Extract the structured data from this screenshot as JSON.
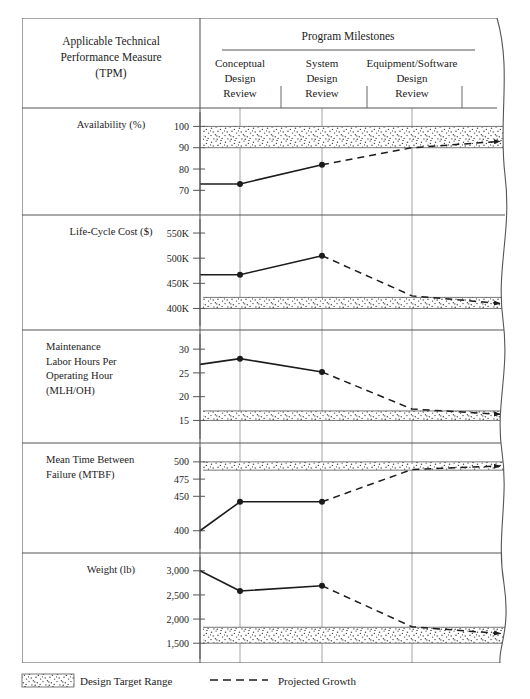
{
  "table": {
    "measure_header": [
      "Applicable Technical",
      "Performance Measure",
      "(TPM)"
    ],
    "milestones_header": "Program Milestones",
    "milestones": [
      {
        "name": "conceptual-design-review",
        "lines": [
          "Conceptual",
          "Design",
          "Review"
        ]
      },
      {
        "name": "system-design-review",
        "lines": [
          "System",
          "Design",
          "Review"
        ]
      },
      {
        "name": "equipment-software-design-review",
        "lines": [
          "Equipment/Software",
          "Design",
          "Review"
        ]
      }
    ]
  },
  "legend": {
    "design_target_range": "Design Target Range",
    "projected_growth": "Projected Growth"
  },
  "colors": {
    "ink": "#1c1c1c",
    "rule": "#555555",
    "grid": "#8a8a96",
    "band_fill": "#ffffff",
    "band_dot": "#2b2b2b",
    "paper": "#ffffff"
  },
  "chart_data": {
    "type": "line",
    "title": "Program Milestones",
    "xlabel": "",
    "grid": true,
    "legend_position": "bottom",
    "x_categories": [
      "Start",
      "Conceptual Design Review",
      "System Design Review",
      "Equipment/Software Design Review"
    ],
    "panels": [
      {
        "id": "availability",
        "label_lines": [
          "Availability (%)"
        ],
        "ylabel": "Availability (%)",
        "ylim": [
          65,
          103
        ],
        "ticks": [
          100,
          90,
          80,
          70
        ],
        "tick_labels": [
          "100",
          "90",
          "80",
          "70"
        ],
        "target_band": {
          "low": 90,
          "high": 100,
          "label": "Design Target Range"
        },
        "actual": {
          "name": "Actual",
          "x": [
            "Start",
            "Conceptual Design Review",
            "System Design Review"
          ],
          "values": [
            73,
            73,
            82
          ]
        },
        "projected": {
          "name": "Projected Growth",
          "x": [
            "System Design Review",
            "Equipment/Software Design Review",
            "End"
          ],
          "values": [
            82,
            90,
            93
          ]
        },
        "direction": "increasing"
      },
      {
        "id": "life-cycle-cost",
        "label_lines": [
          "Life-Cycle Cost ($)"
        ],
        "ylabel": "Life-Cycle Cost ($)",
        "ylim": [
          385,
          562
        ],
        "ticks": [
          550,
          500,
          450,
          400
        ],
        "tick_labels": [
          "550K",
          "500K",
          "450K",
          "400K"
        ],
        "target_band": {
          "low": 400,
          "high": 422,
          "label": "Design Target Range"
        },
        "actual": {
          "name": "Actual",
          "x": [
            "Start",
            "Conceptual Design Review",
            "System Design Review"
          ],
          "values": [
            467,
            467,
            505
          ]
        },
        "projected": {
          "name": "Projected Growth",
          "x": [
            "System Design Review",
            "Equipment/Software Design Review",
            "End"
          ],
          "values": [
            505,
            425,
            410
          ]
        },
        "direction": "decreasing"
      },
      {
        "id": "maintenance-labor-hours",
        "label_lines": [
          "Maintenance",
          "Labor Hours Per",
          "Operating Hour",
          "(MLH/OH)"
        ],
        "ylabel": "Maintenance Labor Hours Per Operating Hour (MLH/OH)",
        "ylim": [
          13.2,
          31.5
        ],
        "ticks": [
          30,
          25,
          20,
          15
        ],
        "tick_labels": [
          "30",
          "25",
          "20",
          "15"
        ],
        "target_band": {
          "low": 15,
          "high": 17,
          "label": "Design Target Range"
        },
        "actual": {
          "name": "Actual",
          "x": [
            "Start",
            "Conceptual Design Review",
            "System Design Review"
          ],
          "values": [
            26.8,
            28.0,
            25.2
          ]
        },
        "projected": {
          "name": "Projected Growth",
          "x": [
            "System Design Review",
            "Equipment/Software Design Review",
            "End"
          ],
          "values": [
            25.2,
            17.4,
            16.3
          ]
        },
        "direction": "decreasing"
      },
      {
        "id": "mean-time-between-failure",
        "label_lines": [
          "Mean Time Between",
          "Failure (MTBF)"
        ],
        "ylabel": "Mean Time Between Failure (MTBF)",
        "ylim": [
          388,
          510
        ],
        "ticks": [
          500,
          475,
          450,
          400
        ],
        "tick_labels": [
          "500",
          "475",
          "450",
          "400"
        ],
        "target_band": {
          "low": 488,
          "high": 500,
          "label": "Design Target Range"
        },
        "actual": {
          "name": "Actual",
          "x": [
            "Start",
            "Conceptual Design Review",
            "System Design Review"
          ],
          "values": [
            400,
            442,
            442
          ]
        },
        "projected": {
          "name": "Projected Growth",
          "x": [
            "System Design Review",
            "Equipment/Software Design Review",
            "End"
          ],
          "values": [
            442,
            489,
            494
          ]
        },
        "direction": "increasing"
      },
      {
        "id": "weight",
        "label_lines": [
          "Weight (lb)"
        ],
        "ylabel": "Weight (lb)",
        "ylim": [
          1380,
          3120
        ],
        "ticks": [
          3000,
          2500,
          2000,
          1500
        ],
        "tick_labels": [
          "3,000",
          "2,500",
          "2,000",
          "1,500"
        ],
        "target_band": {
          "low": 1500,
          "high": 1830,
          "label": "Design Target Range"
        },
        "actual": {
          "name": "Actual",
          "x": [
            "Start",
            "Conceptual Design Review",
            "System Design Review"
          ],
          "values": [
            3000,
            2580,
            2690
          ]
        },
        "projected": {
          "name": "Projected Growth",
          "x": [
            "System Design Review",
            "Equipment/Software Design Review",
            "End"
          ],
          "values": [
            2690,
            1840,
            1700
          ]
        },
        "direction": "decreasing"
      }
    ]
  }
}
